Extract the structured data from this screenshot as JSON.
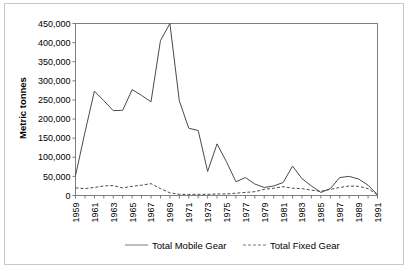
{
  "chart_data": {
    "type": "line",
    "title": "",
    "xlabel": "",
    "ylabel": "Metric tonnes",
    "ylim": [
      0,
      450000
    ],
    "xlim": [
      1959,
      1991
    ],
    "grid": false,
    "legend_position": "bottom",
    "ytick_labels": [
      "450,000",
      "400,000",
      "350,000",
      "300,000",
      "250,000",
      "200,000",
      "150,000",
      "100,000",
      "50,000",
      "0"
    ],
    "ytick_values": [
      450000,
      400000,
      350000,
      300000,
      250000,
      200000,
      150000,
      100000,
      50000,
      0
    ],
    "xtick_labels": [
      "1959",
      "1961",
      "1963",
      "1965",
      "1967",
      "1969",
      "1971",
      "1973",
      "1975",
      "1977",
      "1979",
      "1981",
      "1983",
      "1985",
      "1987",
      "1989",
      "1991"
    ],
    "x": [
      1959,
      1960,
      1961,
      1962,
      1963,
      1964,
      1965,
      1966,
      1967,
      1968,
      1969,
      1970,
      1971,
      1972,
      1973,
      1974,
      1975,
      1976,
      1977,
      1978,
      1979,
      1980,
      1981,
      1982,
      1983,
      1984,
      1985,
      1986,
      1987,
      1988,
      1989,
      1990,
      1991
    ],
    "series": [
      {
        "name": "Total Mobile Gear",
        "style": "solid",
        "color": "#4a4a4a",
        "values": [
          52000,
          165000,
          273000,
          248000,
          222000,
          223000,
          277000,
          262000,
          245000,
          405000,
          450000,
          248000,
          176000,
          170000,
          63000,
          135000,
          88000,
          36000,
          47000,
          30000,
          21000,
          25000,
          34000,
          77000,
          44000,
          25000,
          8000,
          18000,
          47000,
          50000,
          43000,
          27000,
          2000
        ]
      },
      {
        "name": "Total Fixed Gear",
        "style": "dashed",
        "color": "#4a4a4a",
        "values": [
          20000,
          18000,
          21000,
          25000,
          26000,
          20000,
          24000,
          27000,
          31000,
          18000,
          7000,
          3000,
          3000,
          3000,
          3000,
          4000,
          4000,
          6000,
          8000,
          10000,
          16000,
          19000,
          23000,
          19000,
          18000,
          14000,
          11000,
          16000,
          21000,
          25000,
          24000,
          18000,
          2000
        ]
      }
    ],
    "legend": [
      {
        "label": "Total Mobile Gear",
        "style": "solid"
      },
      {
        "label": "Total Fixed Gear",
        "style": "dashed"
      }
    ]
  }
}
